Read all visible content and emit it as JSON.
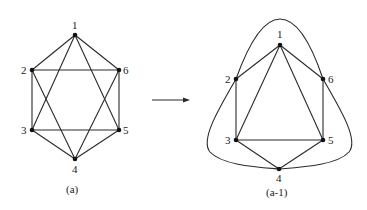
{
  "diagram": {
    "left_graph": {
      "caption": "(a)",
      "nodes": [
        {
          "id": "1",
          "label": "1"
        },
        {
          "id": "2",
          "label": "2"
        },
        {
          "id": "3",
          "label": "3"
        },
        {
          "id": "4",
          "label": "4"
        },
        {
          "id": "5",
          "label": "5"
        },
        {
          "id": "6",
          "label": "6"
        }
      ],
      "edges": [
        [
          "1",
          "2"
        ],
        [
          "1",
          "6"
        ],
        [
          "2",
          "6"
        ],
        [
          "2",
          "3"
        ],
        [
          "6",
          "5"
        ],
        [
          "3",
          "5"
        ],
        [
          "3",
          "4"
        ],
        [
          "4",
          "5"
        ],
        [
          "1",
          "3"
        ],
        [
          "1",
          "5"
        ],
        [
          "2",
          "4"
        ],
        [
          "6",
          "4"
        ]
      ]
    },
    "arrow": "right-arrow",
    "right_graph": {
      "caption": "(a-1)",
      "nodes": [
        {
          "id": "1",
          "label": "1"
        },
        {
          "id": "2",
          "label": "2"
        },
        {
          "id": "3",
          "label": "3"
        },
        {
          "id": "4",
          "label": "4"
        },
        {
          "id": "5",
          "label": "5"
        },
        {
          "id": "6",
          "label": "6"
        }
      ],
      "straight_edges": [
        [
          "1",
          "2"
        ],
        [
          "1",
          "6"
        ],
        [
          "2",
          "3"
        ],
        [
          "6",
          "5"
        ],
        [
          "3",
          "5"
        ],
        [
          "3",
          "4"
        ],
        [
          "4",
          "5"
        ],
        [
          "1",
          "3"
        ],
        [
          "1",
          "5"
        ]
      ],
      "curved_edges": [
        [
          "2",
          "6"
        ],
        [
          "2",
          "4"
        ],
        [
          "6",
          "4"
        ]
      ]
    }
  }
}
